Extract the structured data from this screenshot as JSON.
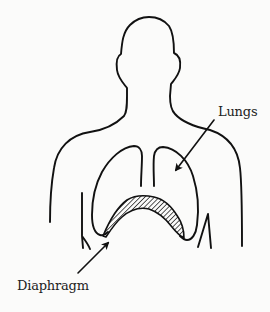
{
  "figure": {
    "labels": {
      "lungs": "Lungs",
      "diaphragm": "Diaphragm"
    },
    "colors": {
      "line": "#111111",
      "background": "#fbfbfa",
      "hatch": "#111111"
    }
  }
}
